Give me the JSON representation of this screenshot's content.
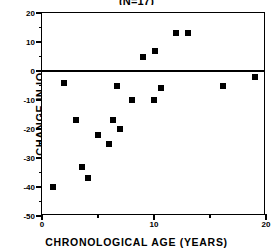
{
  "chart": {
    "title": "(N=17)",
    "xlabel": "CHRONOLOGICAL AGE (YEARS)",
    "ylabel": "CHANGE IN IQ"
  },
  "chart_data": {
    "type": "scatter",
    "title": "(N=17)",
    "xlabel": "CHRONOLOGICAL AGE (YEARS)",
    "ylabel": "CHANGE IN IQ",
    "xlim": [
      0,
      20
    ],
    "ylim": [
      -50,
      20
    ],
    "xticks": [
      0,
      10,
      20
    ],
    "xtick_labels": [
      "0",
      "10",
      "20"
    ],
    "xminor_ticks": [
      5,
      15
    ],
    "yticks": [
      20,
      10,
      0,
      -10,
      -20,
      -30,
      -40,
      -50
    ],
    "ytick_labels": [
      "20",
      "10",
      "0",
      "-10",
      "-20",
      "-30",
      "-40",
      "-50"
    ],
    "yminor_ticks": [
      15,
      5,
      -5,
      -15,
      -25,
      -35,
      -45
    ],
    "grid": false,
    "legend": false,
    "reference_lines": [
      {
        "axis": "y",
        "value": 0
      }
    ],
    "marker": "filled-square",
    "marker_color": "#000000",
    "n": 17,
    "points": [
      {
        "x": 1.0,
        "y": -40
      },
      {
        "x": 2.0,
        "y": -4
      },
      {
        "x": 3.0,
        "y": -17
      },
      {
        "x": 3.6,
        "y": -33
      },
      {
        "x": 4.1,
        "y": -37
      },
      {
        "x": 5.0,
        "y": -22
      },
      {
        "x": 6.0,
        "y": -25
      },
      {
        "x": 6.3,
        "y": -17
      },
      {
        "x": 6.7,
        "y": -5
      },
      {
        "x": 7.0,
        "y": -20
      },
      {
        "x": 8.0,
        "y": -10
      },
      {
        "x": 9.0,
        "y": 5
      },
      {
        "x": 10.0,
        "y": -10
      },
      {
        "x": 10.1,
        "y": 7
      },
      {
        "x": 10.6,
        "y": -6
      },
      {
        "x": 12.0,
        "y": 13
      },
      {
        "x": 13.0,
        "y": 13
      },
      {
        "x": 16.2,
        "y": -5
      },
      {
        "x": 19.0,
        "y": -2
      }
    ]
  }
}
